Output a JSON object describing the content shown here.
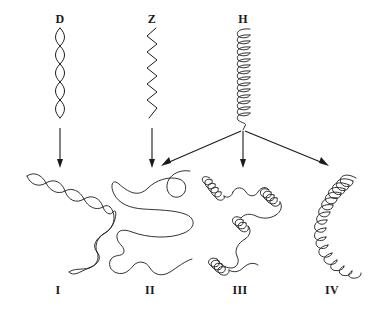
{
  "figure": {
    "background_color": "#ffffff",
    "ink_color": "#1b1b1b",
    "top_row": [
      {
        "id": "D",
        "label": "D",
        "shape": "double-helix-strand",
        "label_x": 60,
        "label_y": 14,
        "center_x": 60,
        "top_y": 28,
        "bottom_y": 118
      },
      {
        "id": "Z",
        "label": "Z",
        "shape": "zigzag-strand",
        "label_x": 152,
        "label_y": 14,
        "center_x": 152,
        "top_y": 28,
        "bottom_y": 118
      },
      {
        "id": "H",
        "label": "H",
        "shape": "tight-coil-helix",
        "label_x": 243,
        "label_y": 14,
        "center_x": 243,
        "top_y": 28,
        "bottom_y": 128
      }
    ],
    "bottom_row": [
      {
        "id": "I",
        "label": "I",
        "shape": "curved-double-helix",
        "label_x": 58,
        "label_y": 288
      },
      {
        "id": "II",
        "label": "II",
        "shape": "random-coil",
        "label_x": 150,
        "label_y": 288
      },
      {
        "id": "III",
        "label": "III",
        "shape": "mixed-helix-and-coil",
        "label_x": 240,
        "label_y": 288
      },
      {
        "id": "IV",
        "label": "IV",
        "shape": "curved-continuous-helix",
        "label_x": 332,
        "label_y": 288
      }
    ],
    "arrows": [
      {
        "id": "d-to-i",
        "from": "D",
        "to": "I",
        "x1": 60,
        "y1": 128,
        "x2": 60,
        "y2": 166
      },
      {
        "id": "z-to-ii",
        "from": "Z",
        "to": "II",
        "x1": 152,
        "y1": 128,
        "x2": 152,
        "y2": 166
      },
      {
        "id": "h-to-ii",
        "from": "H",
        "to": "II",
        "x1": 243,
        "y1": 131,
        "x2": 160,
        "y2": 167
      },
      {
        "id": "h-to-iii",
        "from": "H",
        "to": "III",
        "x1": 243,
        "y1": 131,
        "x2": 243,
        "y2": 166
      },
      {
        "id": "h-to-iv",
        "from": "H",
        "to": "IV",
        "x1": 243,
        "y1": 131,
        "x2": 330,
        "y2": 167
      }
    ]
  }
}
